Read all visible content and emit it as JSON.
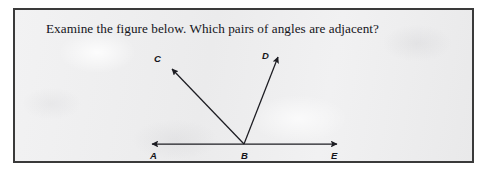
{
  "document": {
    "background_color": "#ffffff",
    "card_background_color": "#efeff0",
    "border_color": "#3a3a3a",
    "ink_color": "#14141a"
  },
  "question": {
    "text": "Examine the figure below. Which pairs of angles are adjacent?"
  },
  "figure": {
    "type": "geometry-diagram",
    "vertex": "B",
    "labels": {
      "A": "A",
      "B": "B",
      "C": "C",
      "D": "D",
      "E": "E"
    },
    "rays": [
      {
        "name": "ray-BA",
        "from": "B",
        "to": "A",
        "arrow": "at-A"
      },
      {
        "name": "ray-BE",
        "from": "B",
        "to": "E",
        "arrow": "at-E"
      },
      {
        "name": "ray-BC",
        "from": "B",
        "to": "C",
        "arrow": "at-C"
      },
      {
        "name": "ray-BD",
        "from": "B",
        "to": "D",
        "arrow": "at-D"
      }
    ],
    "line_color": "#1c1c22"
  }
}
